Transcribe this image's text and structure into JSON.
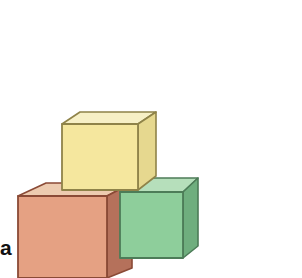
{
  "figure": {
    "panel_label": "a",
    "caption_text": "",
    "background_color": "#FFFFFF",
    "width": 302,
    "height": 278
  },
  "blocks": [
    {
      "name": "yellow-block",
      "label": "yellow cube",
      "colors": {
        "front": "#F5E79E",
        "top": "#F7F0C6",
        "side": "#E6D88F",
        "outline": "#8F8349"
      },
      "geometry": {
        "front": "62,124 138,124 138,190 62,190",
        "top": "62,124 80,112 156,112 138,124",
        "side": "138,124 156,112 156,176 138,190"
      }
    },
    {
      "name": "orange-block",
      "label": "orange cube",
      "colors": {
        "front": "#E5A183",
        "top": "#EDCBB0",
        "side": "#B5715B",
        "outline": "#8A4A36"
      },
      "geometry": {
        "front": "18,196 107,196 107,278 18,278",
        "top": "18,196 46,183 132,183 107,196",
        "side": "107,196 132,183 132,268 107,278"
      }
    },
    {
      "name": "green-block",
      "label": "green cube",
      "colors": {
        "front": "#8ECE9B",
        "top": "#B6DFBB",
        "side": "#6FAE7E",
        "outline": "#4D7C58"
      },
      "geometry": {
        "front": "120,192 183,192 183,258 120,258",
        "top": "120,192 140,178 198,178 183,192",
        "side": "183,192 198,178 198,246 183,258"
      }
    }
  ],
  "palette": {
    "accent_yellow": "#F5E79E",
    "accent_orange": "#E5A183",
    "accent_green": "#8ECE9B",
    "label_color": "#111111"
  }
}
